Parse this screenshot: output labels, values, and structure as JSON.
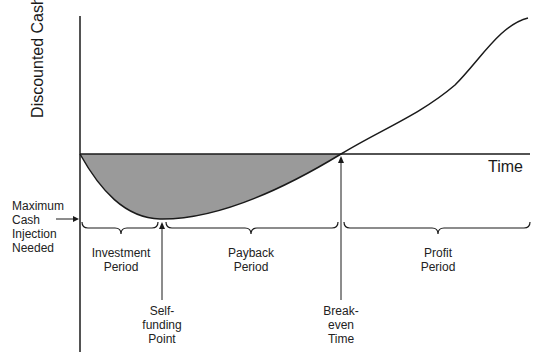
{
  "diagram": {
    "y_axis_label": "Discounted Cash",
    "x_axis_label": "Time",
    "annotations": {
      "max_cash": [
        "Maximum",
        "Cash",
        "Injection",
        "Needed"
      ],
      "investment_period": [
        "Investment",
        "Period"
      ],
      "payback_period": [
        "Payback",
        "Period"
      ],
      "profit_period": [
        "Profit",
        "Period"
      ],
      "self_funding": [
        "Self-",
        "funding",
        "Point"
      ],
      "breakeven": [
        "Break-",
        "even",
        "Time"
      ]
    },
    "colors": {
      "line": "#1a1a1a",
      "fill": "#9a9a9a"
    }
  }
}
